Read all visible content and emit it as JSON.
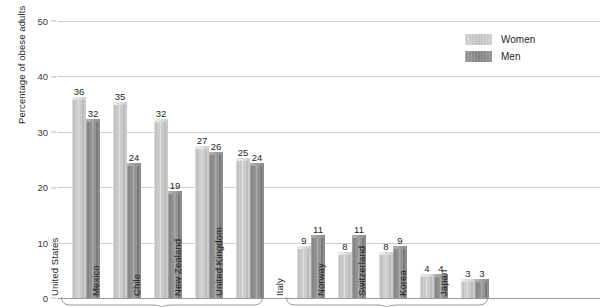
{
  "chart_data": {
    "type": "bar",
    "title": "",
    "xlabel": "",
    "ylabel": "Percentage of obese adults",
    "ylim": [
      0,
      50
    ],
    "yticks": [
      0,
      10,
      20,
      30,
      40,
      50
    ],
    "grid": true,
    "legend_position": "top-right",
    "categories": [
      "United States",
      "Mexico",
      "Chile",
      "New Zealand",
      "United Kingdom",
      "Italy",
      "Norway",
      "Switzerland",
      "Korea",
      "Japan"
    ],
    "series": [
      {
        "name": "Women",
        "values": [
          36,
          35,
          32,
          27,
          25,
          9,
          8,
          8,
          4,
          3
        ]
      },
      {
        "name": "Men",
        "values": [
          32,
          24,
          19,
          26,
          24,
          11,
          11,
          9,
          4,
          3
        ]
      }
    ],
    "groups": [
      {
        "name": "high-prevalence",
        "categories": [
          "United States",
          "Mexico",
          "Chile",
          "New Zealand",
          "United Kingdom"
        ]
      },
      {
        "name": "low-prevalence",
        "categories": [
          "Italy",
          "Norway",
          "Switzerland",
          "Korea",
          "Japan"
        ]
      }
    ]
  },
  "axis": {
    "y_title": "Percentage of obese adults",
    "ticks": [
      "50",
      "40",
      "30",
      "20",
      "10",
      "0"
    ]
  },
  "legend": {
    "entries": [
      {
        "label": "Women",
        "color": "#cccccc"
      },
      {
        "label": "Men",
        "color": "#8c8c8c"
      }
    ]
  },
  "colors": {
    "women": "#cccccc",
    "men": "#8c8c8c",
    "gridline": "#cfcfcf",
    "baseline": "#9a9a9a",
    "text": "#231f20",
    "background": "#ffffff"
  }
}
